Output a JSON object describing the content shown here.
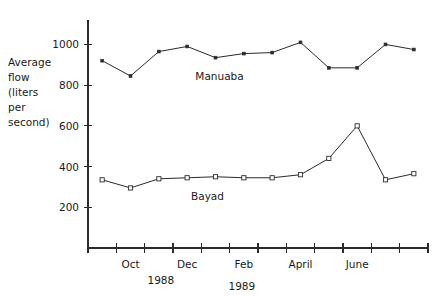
{
  "chart_data": {
    "type": "line",
    "title": "",
    "xlabel": "",
    "ylabel": "Average flow (liters per second)",
    "ylim": [
      0,
      1120
    ],
    "yticks": [
      200,
      400,
      600,
      800,
      1000
    ],
    "grid": false,
    "legend_position": "inline-annotation",
    "x": [
      "Sept",
      "Oct",
      "Nov",
      "Dec",
      "Jan",
      "Feb",
      "March",
      "April",
      "May",
      "June",
      "July",
      "Aug"
    ],
    "xtick_labels": [
      "Oct",
      "Dec",
      "Feb",
      "April",
      "June"
    ],
    "xtick_count": 12,
    "year_labels": [
      {
        "text": "1988",
        "after": "Nov"
      },
      {
        "text": "1989",
        "after": "Jan"
      }
    ],
    "series": [
      {
        "name": "Manuaba",
        "marker": "filled-square",
        "values": [
          920,
          845,
          965,
          990,
          935,
          955,
          960,
          1010,
          885,
          885,
          1000,
          975
        ]
      },
      {
        "name": "Bayad",
        "marker": "open-square",
        "values": [
          335,
          295,
          340,
          345,
          350,
          345,
          345,
          360,
          440,
          600,
          335,
          365
        ]
      }
    ]
  },
  "axis_title": {
    "lines": [
      "Average",
      "flow",
      "(liters",
      "per",
      "second)"
    ]
  },
  "colors": {
    "ink": "#2b2b2b",
    "background": "#ffffff"
  }
}
